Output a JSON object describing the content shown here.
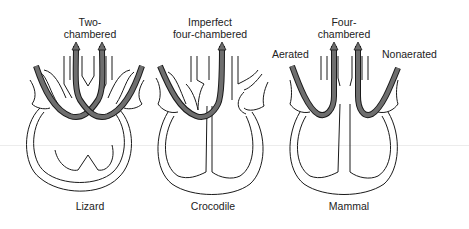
{
  "colors": {
    "outline": "#1a1a1a",
    "tube_fill": "#6e6e6e",
    "background": "#ffffff"
  },
  "panels": [
    {
      "id": "lizard",
      "type_label": "Two-\nchambered",
      "type_line1": "Two-",
      "type_line2": "chambered",
      "caption": "Lizard"
    },
    {
      "id": "crocodile",
      "type_label": "Imperfect four-chambered",
      "type_line1": "Imperfect",
      "type_line2": "four-chambered",
      "caption": "Crocodile"
    },
    {
      "id": "mammal",
      "type_label": "Four-\nchambered",
      "type_line1": "Four-",
      "type_line2": "chambered",
      "caption": "Mammal"
    }
  ],
  "side_labels": {
    "left": "Aerated",
    "right": "Nonaerated"
  }
}
